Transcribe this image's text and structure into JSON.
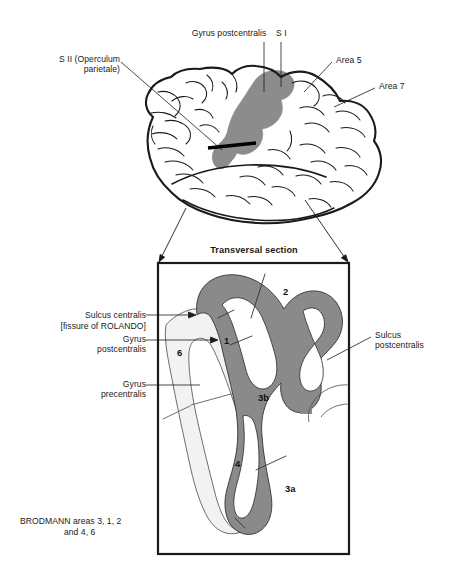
{
  "figure": {
    "title_section": "Transversal section",
    "caption": "BRODMANN areas 3, 1, 2\n                  and 4, 6",
    "colors": {
      "cortex_gray": "#8a8a8a",
      "brain_shade": "#8c8c8c",
      "light_gray": "#f2f2f2",
      "outline": "#1a1a1a",
      "text": "#1a1a1a",
      "background": "#ffffff"
    }
  },
  "brain_view": {
    "name": "lateral-brain-view",
    "labels": [
      {
        "id": "gyrus-postcentralis-top",
        "text": "Gyrus postcentralis"
      },
      {
        "id": "s-one",
        "text": "S I"
      },
      {
        "id": "s-two",
        "text": "S II (Operculum\nparietale)"
      },
      {
        "id": "area-5",
        "text": "Area 5"
      },
      {
        "id": "area-7",
        "text": "Area 7"
      }
    ]
  },
  "section_view": {
    "name": "transversal-section",
    "labels": [
      {
        "id": "sulcus-centralis",
        "text": "Sulcus centralis"
      },
      {
        "id": "fissure-of-rolando",
        "text": "[fissure of ROLANDO]"
      },
      {
        "id": "gyrus-postcentralis",
        "text": "Gyrus\npostcentralis"
      },
      {
        "id": "gyrus-precentralis",
        "text": "Gyrus\nprecentralis"
      },
      {
        "id": "sulcus-postcentralis",
        "text": "Sulcus\npostcentralis"
      }
    ],
    "area_numbers": [
      {
        "id": "area-2",
        "text": "2"
      },
      {
        "id": "area-1",
        "text": "1"
      },
      {
        "id": "area-6",
        "text": "6"
      },
      {
        "id": "area-3b",
        "text": "3b"
      },
      {
        "id": "area-4",
        "text": "4"
      },
      {
        "id": "area-3a",
        "text": "3a"
      }
    ]
  }
}
